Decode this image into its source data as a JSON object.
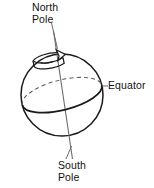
{
  "diagram": {
    "type": "line-drawing",
    "background_color": "#ffffff",
    "stroke_color": "#1a1a1a",
    "text_color": "#111111",
    "labels": {
      "north_pole": {
        "line1": "North",
        "line2": "Pole"
      },
      "equator": {
        "line1": "Equator"
      },
      "south_pole": {
        "line1": "South",
        "line2": "Pole"
      }
    },
    "shapes": {
      "sphere": {
        "name": "globe-outline",
        "center_x": 62,
        "center_y": 95,
        "radius": 41
      },
      "axis": {
        "name": "rotation-axis",
        "x1": 54,
        "y1": 32,
        "x2": 72,
        "y2": 160,
        "tilt_note": "tilted axis through poles"
      },
      "equator_ellipse": {
        "name": "equator-ring",
        "center_x": 62,
        "center_y": 95,
        "rx": 41,
        "ry": 15,
        "rotation_deg": -14,
        "back_arc_style": "dashed",
        "front_arc_style": "solid"
      },
      "rotation_arrow": {
        "name": "rotation-direction-arrow",
        "center_x": 50,
        "center_y": 59,
        "rx": 18,
        "ry": 7,
        "description": "curved 3D arrow encircling the north polar axis"
      }
    },
    "leader_lines": [
      {
        "name": "north-pole-leader",
        "x1": 52,
        "y1": 22,
        "x2": 57,
        "y2": 48
      },
      {
        "name": "equator-leader",
        "x1": 103,
        "y1": 86,
        "x2": 107,
        "y2": 86
      },
      {
        "name": "south-pole-leader",
        "x1": 72,
        "y1": 145,
        "x2": 67,
        "y2": 158
      }
    ]
  }
}
